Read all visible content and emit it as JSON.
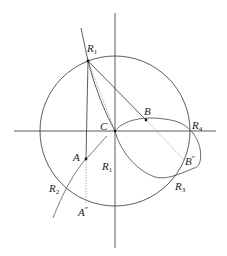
{
  "diagram": {
    "type": "geometric-construction",
    "colors": {
      "stroke": "#333333",
      "dotted": "#777777",
      "point": "#111111",
      "background": "#ffffff"
    },
    "axes": {
      "vertical": {
        "x": 115,
        "y1": 13,
        "y2": 248
      },
      "horizontal": {
        "y": 131,
        "x1": 14,
        "x2": 216
      }
    },
    "circle": {
      "cx": 115,
      "cy": 131,
      "r": 75
    },
    "points": {
      "R1_top": {
        "x": 88,
        "y": 61
      },
      "C": {
        "x": 115,
        "y": 131
      },
      "B": {
        "x": 146,
        "y": 120
      },
      "A": {
        "x": 85,
        "y": 159
      },
      "R4": {
        "x": 190,
        "y": 131
      },
      "R3": {
        "x": 175,
        "y": 175
      },
      "R2": {
        "x": 63,
        "y": 190
      },
      "B_dd": {
        "x": 192,
        "y": 160
      },
      "A_dd": {
        "x": 85,
        "y": 205
      }
    },
    "labels": [
      {
        "id": "R1-top",
        "base": "R",
        "sub": "1",
        "sup": "",
        "x": 87,
        "y": 52
      },
      {
        "id": "B",
        "base": "B",
        "sub": "",
        "sup": "",
        "x": 144,
        "y": 115
      },
      {
        "id": "C",
        "base": "C",
        "sub": "",
        "sup": "",
        "x": 100,
        "y": 130
      },
      {
        "id": "R4",
        "base": "R",
        "sub": "4",
        "sup": "",
        "x": 192,
        "y": 129
      },
      {
        "id": "A",
        "base": "A",
        "sub": "",
        "sup": "",
        "x": 73,
        "y": 161
      },
      {
        "id": "R1-lower",
        "base": "R",
        "sub": "1",
        "sup": "",
        "x": 102,
        "y": 170
      },
      {
        "id": "B-double-prime",
        "base": "B",
        "sub": "",
        "sup": "″",
        "x": 185,
        "y": 165
      },
      {
        "id": "R2",
        "base": "R",
        "sub": "2",
        "sup": "",
        "x": 49,
        "y": 192
      },
      {
        "id": "R3",
        "base": "R",
        "sub": "3",
        "sup": "",
        "x": 175,
        "y": 190
      },
      {
        "id": "A-double-prime",
        "base": "A",
        "sub": "",
        "sup": "″",
        "x": 78,
        "y": 216
      }
    ]
  }
}
